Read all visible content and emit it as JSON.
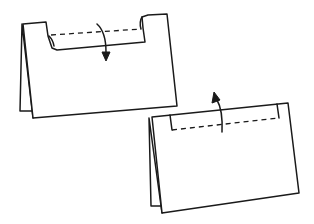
{
  "figure": {
    "type": "folding-instruction-diagram",
    "colors": {
      "ink": "#1a1a1a",
      "background": "#ffffff"
    },
    "steps": [
      {
        "name": "fold-tab-down",
        "description": "Tent-folded card with top strip folded down along dashed line",
        "arrow_direction": "down"
      },
      {
        "name": "fold-tab-up",
        "description": "Tent-folded card with strip folded back up along dashed line",
        "arrow_direction": "up"
      }
    ]
  }
}
